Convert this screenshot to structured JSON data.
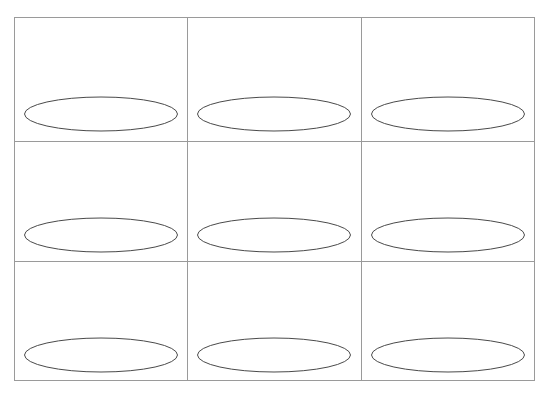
{
  "figure": {
    "type": "grid-of-ellipses",
    "background_color": "#ffffff",
    "grid_line_color": "#9a9a9a",
    "ellipse_stroke_color": "#4a4a4a",
    "ellipse_fill": "none",
    "grid_line_width": 1,
    "ellipse_line_width": 1,
    "rows": 3,
    "columns": 3,
    "cell_count": 9,
    "frame": {
      "left": 14,
      "top": 17,
      "right": 534,
      "bottom": 380,
      "width": 520,
      "height": 363
    },
    "column_edges": [
      14,
      187,
      361,
      534
    ],
    "row_edges": [
      17,
      141,
      261,
      380
    ],
    "ellipse_radius_x": 76.5,
    "ellipse_radius_y": 17,
    "cells": [
      {
        "name": "cell-r1-c1",
        "row": 1,
        "column": 1,
        "x": 14,
        "y": 17,
        "width": 173,
        "height": 124,
        "ellipse_cx": 101,
        "ellipse_cy": 114
      },
      {
        "name": "cell-r1-c2",
        "row": 1,
        "column": 2,
        "x": 187,
        "y": 17,
        "width": 174,
        "height": 124,
        "ellipse_cx": 274,
        "ellipse_cy": 114
      },
      {
        "name": "cell-r1-c3",
        "row": 1,
        "column": 3,
        "x": 361,
        "y": 17,
        "width": 173,
        "height": 124,
        "ellipse_cx": 448,
        "ellipse_cy": 114
      },
      {
        "name": "cell-r2-c1",
        "row": 2,
        "column": 1,
        "x": 14,
        "y": 141,
        "width": 173,
        "height": 120,
        "ellipse_cx": 101,
        "ellipse_cy": 235
      },
      {
        "name": "cell-r2-c2",
        "row": 2,
        "column": 2,
        "x": 187,
        "y": 141,
        "width": 174,
        "height": 120,
        "ellipse_cx": 274,
        "ellipse_cy": 235
      },
      {
        "name": "cell-r2-c3",
        "row": 2,
        "column": 3,
        "x": 361,
        "y": 141,
        "width": 173,
        "height": 120,
        "ellipse_cx": 448,
        "ellipse_cy": 235
      },
      {
        "name": "cell-r3-c1",
        "row": 3,
        "column": 1,
        "x": 14,
        "y": 261,
        "width": 173,
        "height": 119,
        "ellipse_cx": 101,
        "ellipse_cy": 355
      },
      {
        "name": "cell-r3-c2",
        "row": 3,
        "column": 2,
        "x": 187,
        "y": 261,
        "width": 174,
        "height": 119,
        "ellipse_cx": 274,
        "ellipse_cy": 355
      },
      {
        "name": "cell-r3-c3",
        "row": 3,
        "column": 3,
        "x": 361,
        "y": 261,
        "width": 173,
        "height": 119,
        "ellipse_cx": 448,
        "ellipse_cy": 355
      }
    ]
  }
}
